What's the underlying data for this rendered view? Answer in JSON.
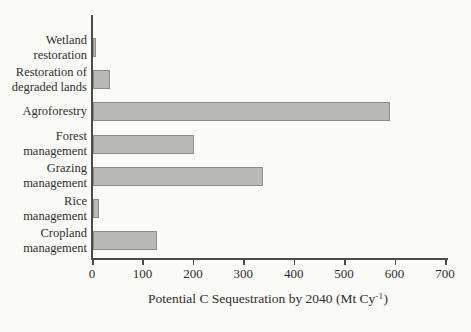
{
  "chart_data": {
    "type": "bar",
    "orientation": "horizontal",
    "title": "",
    "categories": [
      "Wetland restoration",
      "Restoration of degraded lands",
      "Agroforestry",
      "Forest management",
      "Grazing management",
      "Rice management",
      "Cropland management"
    ],
    "category_label_lines": [
      [
        "Wetland",
        "restoration"
      ],
      [
        "Restoration of",
        "degraded lands"
      ],
      [
        "Agroforestry"
      ],
      [
        "Forest",
        "management"
      ],
      [
        "Grazing",
        "management"
      ],
      [
        "Rice",
        "management"
      ],
      [
        "Cropland",
        "management"
      ]
    ],
    "values": [
      5,
      33,
      588,
      200,
      338,
      12,
      126
    ],
    "xlabel": "Potential C Sequestration by 2040 (Mt Cy-1)",
    "xlabel_main": "Potential C Sequestration by 2040 (Mt Cy",
    "xlabel_superscript": "-1",
    "xlabel_close": ")",
    "xlim": [
      0,
      700
    ],
    "xticks": [
      "0",
      "100",
      "200",
      "300",
      "400",
      "500",
      "600",
      "700"
    ],
    "grid": false,
    "legend": null,
    "colors": {
      "bar_fill": "#b9bab6",
      "bar_border": "#8d8e8a",
      "axis_line": "#4b4b49",
      "text": "#2e2d2b",
      "background": "#fbfbf8"
    }
  }
}
